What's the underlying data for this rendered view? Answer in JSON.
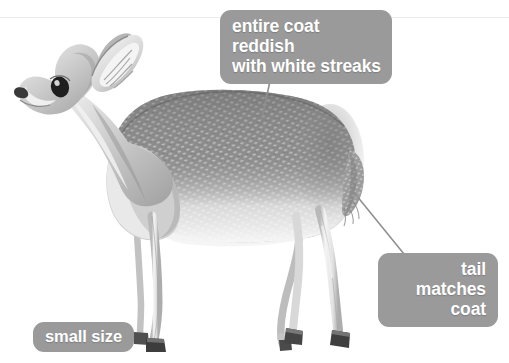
{
  "figure": {
    "style": "grayscale pencil illustration",
    "background_color": "#ffffff"
  },
  "palette": {
    "label_background": "#9a9a9a",
    "label_text": "#ffffff",
    "leader_line": "#8e8e8e",
    "coat_dark": "#6f6f6f",
    "coat_mid": "#9d9d9d",
    "coat_light": "#d9d9d9",
    "belly": "#efefef",
    "hoof_dark": "#3b3b3b",
    "eye_dark": "#2a2a2a"
  },
  "callouts": [
    {
      "id": "coat",
      "name": "coat-callout",
      "line1": "entire coat reddish",
      "line2": "with white streaks",
      "align": "left",
      "points_to": "back / mid-body coat"
    },
    {
      "id": "tail",
      "name": "tail-callout",
      "line1": "tail matches",
      "line2": "coat",
      "align": "right",
      "points_to": "tail at rump"
    },
    {
      "id": "size",
      "name": "size-callout",
      "line1": "small size",
      "line2": "",
      "align": "center",
      "points_to": "overall body"
    }
  ],
  "anatomy": {
    "parts": [
      "ear",
      "eye",
      "muzzle",
      "neck",
      "shoulder",
      "back",
      "flank",
      "belly",
      "rump",
      "tail",
      "foreleg",
      "hind-leg",
      "hoof"
    ]
  }
}
